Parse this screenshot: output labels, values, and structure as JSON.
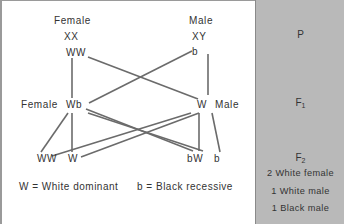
{
  "parents": {
    "female": {
      "label": "Female",
      "chromosomes": "XX",
      "genotype": "WW"
    },
    "male": {
      "label": "Male",
      "chromosomes": "XY",
      "genotype": "b"
    }
  },
  "f1": {
    "female": {
      "label": "Female",
      "genotype": "Wb"
    },
    "male": {
      "label": "Male",
      "genotype": "W"
    }
  },
  "f2": {
    "offspring": [
      "WW",
      "W",
      "bW",
      "b"
    ]
  },
  "legend": {
    "dominant": "W = White dominant",
    "recessive": "b = Black recessive"
  },
  "generations": {
    "p": "P",
    "f1_base": "F",
    "f1_sub": "1",
    "f2_base": "F",
    "f2_sub": "2",
    "f2_results": [
      "2 White female",
      "1 White male",
      "1 Black male"
    ]
  },
  "colors": {
    "line": "#6b6b6b",
    "panel": "#b9b9b9",
    "text": "#333333"
  }
}
